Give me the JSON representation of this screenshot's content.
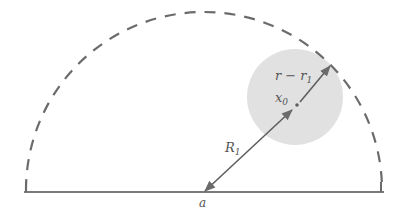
{
  "diagram": {
    "type": "geometry-diagram",
    "colors": {
      "line": "#6b6b6b",
      "dashed_arc": "#6b6b6b",
      "shaded_circle": "#dcdcdc",
      "label": "#555555"
    },
    "labels": {
      "r_minus_r1": "r − r",
      "r_minus_r1_sub": "1",
      "x0": "x",
      "x0_sub": "0",
      "R1": "R",
      "R1_sub": "1",
      "a": "a"
    },
    "geometry": {
      "semicircle_center": [
        204,
        192
      ],
      "semicircle_radius": 178,
      "baseline": {
        "x1": 26,
        "x2": 381,
        "y": 192
      },
      "shaded_circle": {
        "cx": 295,
        "cy": 97,
        "r": 48
      },
      "point_a": [
        204,
        192
      ],
      "point_x0": [
        298,
        104
      ],
      "boundary_point": [
        330,
        65
      ]
    }
  }
}
